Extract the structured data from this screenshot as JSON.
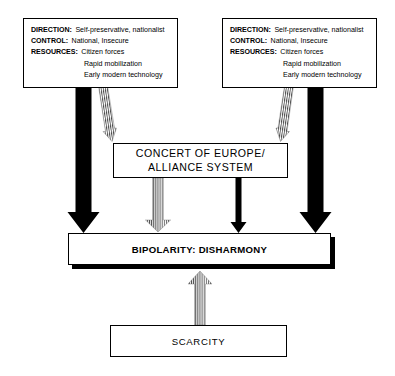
{
  "diagram": {
    "colors": {
      "ink": "#000000",
      "paper": "#ffffff",
      "hatch": "#555555"
    },
    "actor_left": {
      "name": "left-actor-box",
      "rows": [
        {
          "key": "DIRECTION:",
          "value": "Self-preservative, nationalist"
        },
        {
          "key": "CONTROL:",
          "value": "National, Insecure"
        },
        {
          "key": "RESOURCES:",
          "value": "Citizen forces"
        }
      ],
      "sub_values": [
        "Rapid mobilization",
        "Early modern technology"
      ]
    },
    "actor_right": {
      "name": "right-actor-box",
      "rows": [
        {
          "key": "DIRECTION:",
          "value": "Self-preservative, nationalist"
        },
        {
          "key": "CONTROL:",
          "value": "National, Insecure"
        },
        {
          "key": "RESOURCES:",
          "value": "Citizen forces"
        }
      ],
      "sub_values": [
        "Rapid mobilization",
        "Early modern technology"
      ]
    },
    "institution_box": {
      "line1": "CONCERT OF EUROPE/",
      "line2": "ALLIANCE SYSTEM"
    },
    "outcome_box": {
      "label": "BIPOLARITY: DISHARMONY"
    },
    "constraint_box": {
      "label": "SCARCITY"
    },
    "connectors": [
      {
        "name": "left-actor-to-outcome-arrow",
        "style": "solid-black",
        "direction": "down"
      },
      {
        "name": "left-actor-to-institution-arrow",
        "style": "hatched",
        "direction": "down"
      },
      {
        "name": "right-actor-to-outcome-arrow",
        "style": "solid-black",
        "direction": "down"
      },
      {
        "name": "right-actor-to-institution-arrow",
        "style": "hatched",
        "direction": "down"
      },
      {
        "name": "institution-to-outcome-solid-arrow",
        "style": "solid-black",
        "direction": "down"
      },
      {
        "name": "institution-to-outcome-hatched-arrow",
        "style": "hatched",
        "direction": "down"
      },
      {
        "name": "scarcity-to-outcome-arrow",
        "style": "hatched",
        "direction": "up"
      }
    ]
  }
}
